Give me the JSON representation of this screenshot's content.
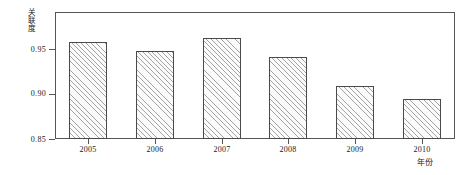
{
  "chart_data": {
    "type": "bar",
    "title": "",
    "subtitle": "",
    "xlabel": "年份",
    "ylabel": "关联度",
    "categories": [
      "2005",
      "2006",
      "2007",
      "2008",
      "2009",
      "2010"
    ],
    "values": [
      0.958,
      0.948,
      0.962,
      0.941,
      0.909,
      0.894
    ],
    "series": [
      {
        "name": "关联度",
        "values": [
          0.958,
          0.948,
          0.962,
          0.941,
          0.909,
          0.894
        ]
      }
    ],
    "ylim": [
      0.85,
      0.98
    ],
    "xlim": [
      "2005",
      "2010"
    ],
    "ytick_labels": [
      "0.85",
      "0.90",
      "0.95"
    ],
    "ytick_values": [
      0.85,
      0.9,
      0.95
    ],
    "xtick_labels": [
      "2005",
      "2006",
      "2007",
      "2008",
      "2009",
      "2010"
    ],
    "grid": false,
    "legend": null,
    "legend_position": "none",
    "annotations": [],
    "bar_fill": "hatched-diagonal",
    "bar_edge_color": "#4a4a4a",
    "bar_face_color": "#fbfbfb",
    "axis_color": "#555555",
    "text_color": "#1a1a1a",
    "background_color": "#ffffff"
  }
}
